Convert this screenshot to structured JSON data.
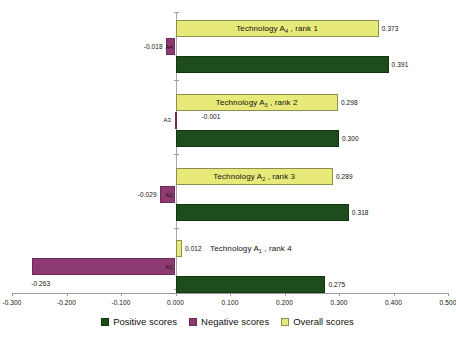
{
  "chart_data": {
    "type": "bar",
    "orientation": "horizontal",
    "title": "",
    "xlabel": "",
    "ylabel": "",
    "xlim": [
      -0.3,
      0.5
    ],
    "xticks": [
      "-0.300",
      "-0.200",
      "-0.100",
      "0.000",
      "0.100",
      "0.200",
      "0.300",
      "0.400",
      "0.500"
    ],
    "xtick_values": [
      -0.3,
      -0.2,
      -0.1,
      0.0,
      0.1,
      0.2,
      0.3,
      0.4,
      0.5
    ],
    "grid": false,
    "legend_position": "bottom",
    "categories": [
      "A4",
      "A3",
      "A2",
      "A1"
    ],
    "series": [
      {
        "name": "Positive scores",
        "color": "#1d4d1d",
        "values": [
          0.391,
          0.3,
          0.318,
          0.275
        ]
      },
      {
        "name": "Negative scores",
        "color": "#8e3a72",
        "values": [
          -0.018,
          -0.001,
          -0.029,
          -0.263
        ]
      },
      {
        "name": "Overall scores",
        "color": "#e7ea79",
        "values": [
          0.373,
          0.298,
          0.289,
          0.012
        ]
      }
    ],
    "annotations": [
      "Technology A4 , rank 1",
      "Technology A3 , rank 2",
      "Technology A2 , rank 3",
      "Technology A1 , rank 4"
    ]
  },
  "groups": [
    {
      "tag": "A4",
      "series_label_prefix": "Technology A",
      "series_label_sub": "4",
      "series_label_suffix": " , rank 1",
      "overall": {
        "value": 0.373,
        "label": "0.373"
      },
      "negative": {
        "value": -0.018,
        "label": "-0.018"
      },
      "positive": {
        "value": 0.391,
        "label": "0.391"
      }
    },
    {
      "tag": "A3",
      "series_label_prefix": "Technology A",
      "series_label_sub": "3",
      "series_label_suffix": " , rank 2",
      "overall": {
        "value": 0.298,
        "label": "0.298"
      },
      "negative": {
        "value": -0.001,
        "label": "-0.001"
      },
      "positive": {
        "value": 0.3,
        "label": "0.300"
      }
    },
    {
      "tag": "A2",
      "series_label_prefix": "Technology A",
      "series_label_sub": "2",
      "series_label_suffix": " , rank 3",
      "overall": {
        "value": 0.289,
        "label": "0.289"
      },
      "negative": {
        "value": -0.029,
        "label": "-0.029"
      },
      "positive": {
        "value": 0.318,
        "label": "0.318"
      }
    },
    {
      "tag": "A1",
      "series_label_prefix": "Technology A",
      "series_label_sub": "1",
      "series_label_suffix": " , rank 4",
      "overall": {
        "value": 0.012,
        "label": "0.012"
      },
      "negative": {
        "value": -0.263,
        "label": "-0.263"
      },
      "positive": {
        "value": 0.275,
        "label": "0.275"
      }
    }
  ],
  "legend": {
    "items": [
      {
        "label": "Positive scores",
        "swatch": "positive"
      },
      {
        "label": "Negative scores",
        "swatch": "negative"
      },
      {
        "label": "Overall scores",
        "swatch": "overall"
      }
    ]
  }
}
